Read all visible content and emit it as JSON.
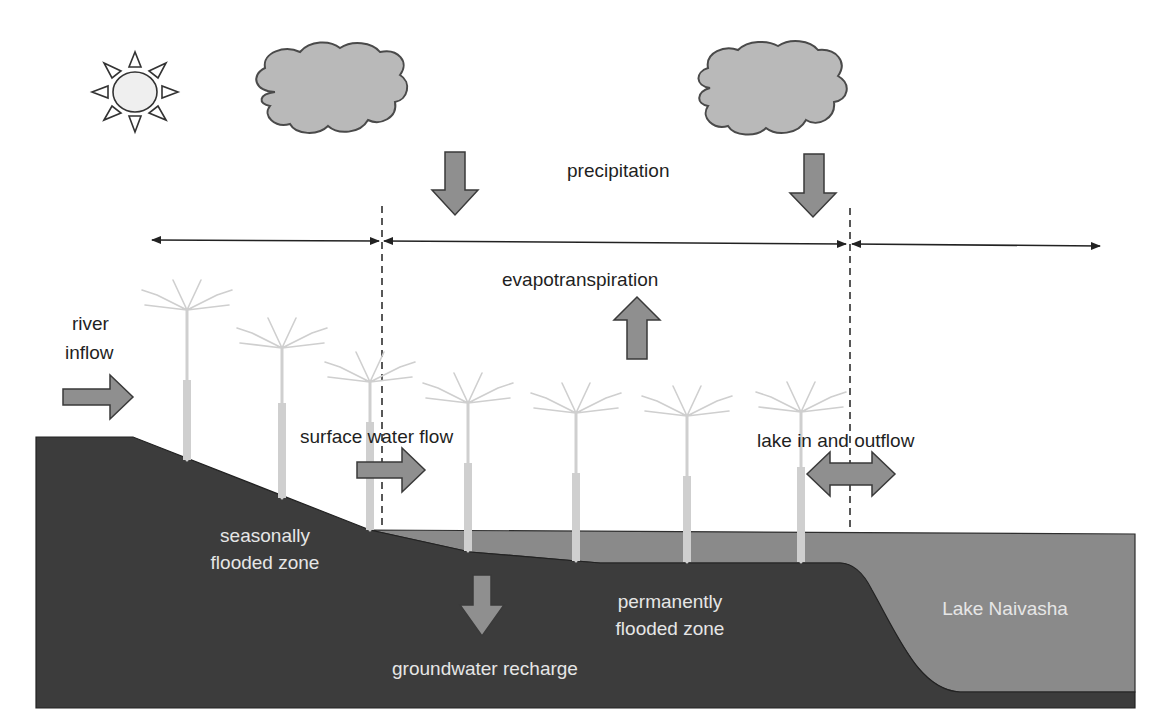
{
  "diagram": {
    "colors": {
      "background": "#ffffff",
      "ground": "#3c3c3c",
      "water": "#8a8a8a",
      "arrow_fill": "#8f8f8f",
      "arrow_stroke": "#3a3a3a",
      "cloud_fill": "#b9b9b9",
      "cloud_stroke": "#4a4a4a",
      "sun_fill": "#f0f0f0",
      "papyrus": "#cfcfcf",
      "label_dark": "#1f1f1f",
      "label_light": "#e6e6e6"
    },
    "icons": {
      "sun": "sun-icon",
      "clouds": [
        "cloud-icon",
        "cloud-icon"
      ],
      "papyrus_count": 8
    },
    "labels": {
      "precipitation": "precipitation",
      "evapotranspiration": "evapotranspiration",
      "river_inflow_line1": "river",
      "river_inflow_line2": "inflow",
      "surface_water_flow": "surface water flow",
      "lake_in_out_flow": "lake in and outflow",
      "seasonal_zone_line1": "seasonally",
      "seasonal_zone_line2": "flooded zone",
      "permanent_zone_line1": "permanently",
      "permanent_zone_line2": "flooded zone",
      "lake_name": "Lake Naivasha",
      "groundwater_recharge": "groundwater recharge"
    },
    "zones": [
      {
        "name": "seasonally flooded zone",
        "x_start": 150,
        "x_end": 381
      },
      {
        "name": "permanently flooded zone",
        "x_start": 381,
        "x_end": 849
      },
      {
        "name": "Lake Naivasha",
        "x_start": 849,
        "x_end": 1100
      }
    ],
    "flows": [
      {
        "name": "precipitation",
        "direction": "down",
        "count": 2
      },
      {
        "name": "evapotranspiration",
        "direction": "up"
      },
      {
        "name": "river inflow",
        "direction": "right"
      },
      {
        "name": "surface water flow",
        "direction": "right"
      },
      {
        "name": "lake in and outflow",
        "direction": "both"
      },
      {
        "name": "groundwater recharge",
        "direction": "down"
      }
    ]
  }
}
